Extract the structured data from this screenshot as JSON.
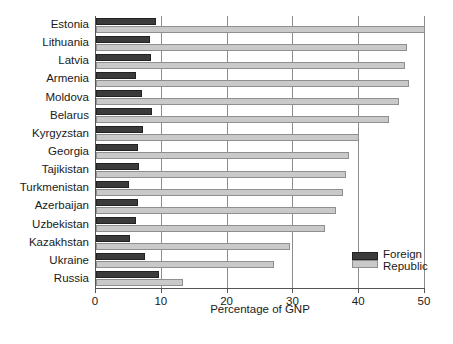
{
  "chart_data": {
    "type": "bar",
    "orientation": "horizontal",
    "title": "",
    "xlabel": "Percentage of GNP",
    "ylabel": "",
    "xlim": [
      0,
      50
    ],
    "xticks": [
      0,
      10,
      20,
      30,
      40,
      50
    ],
    "xtick_labels": [
      "0",
      "10",
      "20",
      "30",
      "40",
      "50"
    ],
    "grid": true,
    "grid_axis": "x",
    "legend_position": "lower-right",
    "categories": [
      "Estonia",
      "Lithuania",
      "Latvia",
      "Armenia",
      "Moldova",
      "Belarus",
      "Kyrgyzstan",
      "Georgia",
      "Tajikistan",
      "Turkmenistan",
      "Azerbaijan",
      "Uzbekistan",
      "Kazakhstan",
      "Ukraine",
      "Russia"
    ],
    "series": [
      {
        "name": "Foreign",
        "color": "#3b3b3b",
        "values": [
          9.1,
          8.2,
          8.3,
          6.1,
          7.0,
          8.5,
          7.1,
          6.4,
          6.6,
          5.0,
          6.4,
          6.1,
          5.1,
          7.4,
          9.6
        ]
      },
      {
        "name": "Republic",
        "color": "#c9c9c9",
        "values": [
          50.0,
          47.3,
          47.0,
          47.5,
          46.0,
          44.5,
          40.0,
          38.5,
          38.0,
          37.5,
          36.5,
          34.8,
          29.5,
          27.0,
          13.2
        ]
      }
    ]
  },
  "legend": {
    "entries": [
      {
        "label": "Foreign",
        "swatch": "dark-swatch"
      },
      {
        "label": "Republic",
        "swatch": "light-swatch"
      }
    ]
  }
}
